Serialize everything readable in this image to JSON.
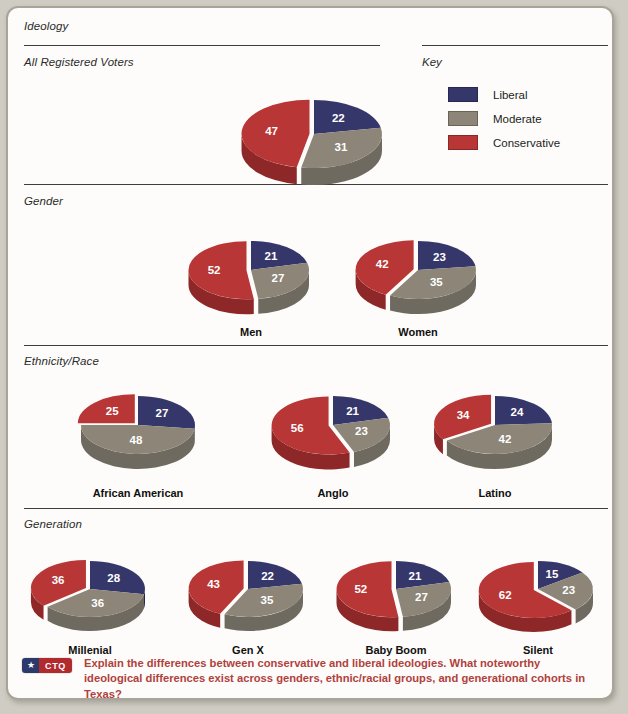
{
  "sections": {
    "ideology_label": "Ideology",
    "all_voters_label": "All Registered Voters",
    "gender_label": "Gender",
    "ethnicity_label": "Ethnicity/Race",
    "generation_label": "Generation"
  },
  "key": {
    "title": "Key",
    "items": [
      {
        "label": "Liberal",
        "color": "#35376b"
      },
      {
        "label": "Moderate",
        "color": "#8c8578"
      },
      {
        "label": "Conservative",
        "color": "#b83636"
      }
    ]
  },
  "colors": {
    "liberal": "#35376b",
    "moderate": "#8c8578",
    "conservative": "#b83636",
    "liberal_side": "#24264c",
    "moderate_side": "#6f6a5f",
    "conservative_side": "#8e2828",
    "rule": "#3d3d3d",
    "label_text": "#2b2b2b",
    "ctq_text": "#b0413c",
    "ctq_badge_blue": "#2c3a6b",
    "ctq_badge_red": "#b02a2e",
    "page_bg": "#cfccc3",
    "card_bg": "#fdfcfa",
    "card_border": "#a8a598"
  },
  "ctq": {
    "star_glyph": "★",
    "tag": "CTQ",
    "question": "Explain the differences between conservative and liberal ideologies. What noteworthy ideological differences exist across genders, ethnic/racial groups, and generational cohorts in Texas?"
  },
  "chart_data": {
    "type": "pie",
    "title": "Ideology",
    "legend": [
      "Liberal",
      "Moderate",
      "Conservative"
    ],
    "legend_position": "top-right",
    "units": "percent",
    "charts": [
      {
        "group": "All Registered Voters",
        "name": "",
        "categories": [
          "Liberal",
          "Moderate",
          "Conservative"
        ],
        "values": [
          22,
          31,
          47
        ]
      },
      {
        "group": "Gender",
        "name": "Men",
        "categories": [
          "Liberal",
          "Moderate",
          "Conservative"
        ],
        "values": [
          21,
          27,
          52
        ]
      },
      {
        "group": "Gender",
        "name": "Women",
        "categories": [
          "Liberal",
          "Moderate",
          "Conservative"
        ],
        "values": [
          23,
          35,
          42
        ]
      },
      {
        "group": "Ethnicity/Race",
        "name": "African American",
        "categories": [
          "Liberal",
          "Moderate",
          "Conservative"
        ],
        "values": [
          27,
          48,
          25
        ]
      },
      {
        "group": "Ethnicity/Race",
        "name": "Anglo",
        "categories": [
          "Liberal",
          "Moderate",
          "Conservative"
        ],
        "values": [
          21,
          23,
          56
        ]
      },
      {
        "group": "Ethnicity/Race",
        "name": "Latino",
        "categories": [
          "Liberal",
          "Moderate",
          "Conservative"
        ],
        "values": [
          24,
          42,
          34
        ]
      },
      {
        "group": "Generation",
        "name": "Millenial",
        "categories": [
          "Liberal",
          "Moderate",
          "Conservative"
        ],
        "values": [
          28,
          36,
          36
        ]
      },
      {
        "group": "Generation",
        "name": "Gen X",
        "categories": [
          "Liberal",
          "Moderate",
          "Conservative"
        ],
        "values": [
          22,
          35,
          43
        ]
      },
      {
        "group": "Generation",
        "name": "Baby Boom",
        "categories": [
          "Liberal",
          "Moderate",
          "Conservative"
        ],
        "values": [
          21,
          27,
          52
        ]
      },
      {
        "group": "Generation",
        "name": "Silent",
        "categories": [
          "Liberal",
          "Moderate",
          "Conservative"
        ],
        "values": [
          15,
          23,
          62
        ]
      }
    ]
  },
  "layout": {
    "pies": [
      {
        "idx": 0,
        "cx": 306,
        "cy": 126,
        "rx": 68,
        "ry": 34,
        "depth": 17,
        "label_y": 0
      },
      {
        "idx": 1,
        "cx": 243,
        "cy": 262,
        "rx": 58,
        "ry": 29,
        "depth": 15,
        "label_y": 318
      },
      {
        "idx": 2,
        "cx": 410,
        "cy": 262,
        "rx": 58,
        "ry": 29,
        "depth": 15,
        "label_y": 318
      },
      {
        "idx": 3,
        "cx": 130,
        "cy": 417,
        "rx": 57,
        "ry": 29,
        "depth": 15,
        "label_y": 479
      },
      {
        "idx": 4,
        "cx": 325,
        "cy": 417,
        "rx": 57,
        "ry": 29,
        "depth": 15,
        "label_y": 479
      },
      {
        "idx": 5,
        "cx": 487,
        "cy": 417,
        "rx": 57,
        "ry": 29,
        "depth": 15,
        "label_y": 479
      },
      {
        "idx": 6,
        "cx": 82,
        "cy": 581,
        "rx": 55,
        "ry": 28,
        "depth": 14,
        "label_y": 636
      },
      {
        "idx": 7,
        "cx": 240,
        "cy": 581,
        "rx": 55,
        "ry": 28,
        "depth": 14,
        "label_y": 636
      },
      {
        "idx": 8,
        "cx": 388,
        "cy": 581,
        "rx": 55,
        "ry": 28,
        "depth": 14,
        "label_y": 636
      },
      {
        "idx": 9,
        "cx": 530,
        "cy": 581,
        "rx": 55,
        "ry": 28,
        "depth": 14,
        "label_y": 636
      }
    ]
  }
}
